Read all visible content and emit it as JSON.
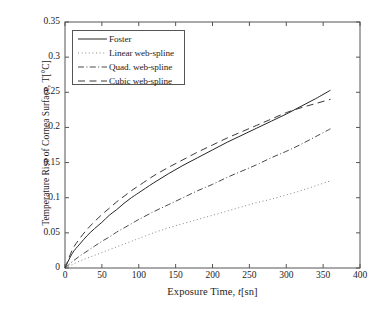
{
  "chart_data": {
    "type": "line",
    "title": "",
    "xlabel": "Exposure Time, t[sn]",
    "xlabel_prefix": "Exposure Time, ",
    "xlabel_italic": "t",
    "xlabel_suffix": "[sn]",
    "ylabel": "Temperature Rise of Cornea Surface, T[°C]",
    "xlim": [
      0,
      400
    ],
    "ylim": [
      0,
      0.35
    ],
    "xticks": [
      0,
      50,
      100,
      150,
      200,
      250,
      300,
      350,
      400
    ],
    "yticks": [
      0,
      0.05,
      0.1,
      0.15,
      0.2,
      0.25,
      0.3,
      0.35
    ],
    "xtick_labels": [
      "0",
      "50",
      "100",
      "150",
      "200",
      "250",
      "300",
      "350",
      "400"
    ],
    "ytick_labels": [
      "0",
      "0.05",
      "0.1",
      "0.15",
      "0.2",
      "0.25",
      "0.3",
      "0.35"
    ],
    "grid": false,
    "legend_position": "upper-left",
    "x": [
      0,
      10,
      20,
      30,
      40,
      50,
      60,
      70,
      80,
      90,
      100,
      120,
      140,
      160,
      180,
      200,
      220,
      240,
      260,
      280,
      300,
      320,
      340,
      360
    ],
    "series": [
      {
        "name": "Foster",
        "style": "solid",
        "color": "#262626",
        "values": [
          0,
          0.021,
          0.034,
          0.046,
          0.056,
          0.065,
          0.075,
          0.083,
          0.092,
          0.1,
          0.107,
          0.121,
          0.134,
          0.146,
          0.157,
          0.168,
          0.179,
          0.189,
          0.199,
          0.209,
          0.219,
          0.23,
          0.241,
          0.253
        ]
      },
      {
        "name": "Linear web-spline",
        "style": "dotted",
        "color": "#8a8a8a",
        "values": [
          0,
          0.005,
          0.01,
          0.014,
          0.018,
          0.022,
          0.026,
          0.03,
          0.034,
          0.038,
          0.042,
          0.05,
          0.057,
          0.063,
          0.069,
          0.075,
          0.081,
          0.087,
          0.093,
          0.098,
          0.104,
          0.11,
          0.117,
          0.124
        ]
      },
      {
        "name": "Quad. web-spline",
        "style": "dashdot",
        "color": "#4a4a4a",
        "values": [
          0,
          0.009,
          0.017,
          0.024,
          0.031,
          0.038,
          0.044,
          0.051,
          0.057,
          0.063,
          0.069,
          0.08,
          0.09,
          0.1,
          0.11,
          0.119,
          0.129,
          0.138,
          0.147,
          0.157,
          0.166,
          0.176,
          0.187,
          0.198
        ]
      },
      {
        "name": "Cubic web-spline",
        "style": "dashed",
        "color": "#3a3a3a",
        "values": [
          0,
          0.026,
          0.042,
          0.055,
          0.066,
          0.076,
          0.085,
          0.094,
          0.102,
          0.11,
          0.117,
          0.131,
          0.143,
          0.154,
          0.165,
          0.175,
          0.185,
          0.194,
          0.203,
          0.212,
          0.221,
          0.228,
          0.234,
          0.24
        ]
      }
    ]
  },
  "legend": {
    "items": [
      {
        "label": "Foster"
      },
      {
        "label": "Linear web-spline"
      },
      {
        "label": "Quad. web-spline"
      },
      {
        "label": "Cubic web-spline"
      }
    ]
  }
}
